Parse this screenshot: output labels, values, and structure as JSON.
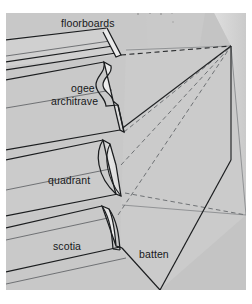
{
  "figure": {
    "name": "moulding-perspective-diagram",
    "kind": "architectural-perspective-drawing",
    "background_color": "#ffffff",
    "panel_color": "#c9c9c9",
    "wall_color": "#d9d9d9",
    "wall_shadow_color": "#bdbdbd",
    "moulding_face_color": "#d2d2d2",
    "moulding_highlight_color": "#e2e2e2",
    "line_color": "#17191b",
    "construction_line_color": "#7d7f82"
  },
  "labels": {
    "floorboards": "floorboards",
    "ogee": "ogee",
    "architrave": "architrave",
    "quadrant": "quadrant",
    "scotia": "scotia",
    "batten": "batten"
  },
  "label_positions": {
    "floorboards": {
      "x": 61,
      "y": 27
    },
    "ogee": {
      "x": 71,
      "y": 92
    },
    "architrave": {
      "x": 51,
      "y": 105
    },
    "quadrant": {
      "x": 48,
      "y": 184
    },
    "scotia": {
      "x": 53,
      "y": 250
    },
    "batten": {
      "x": 139,
      "y": 258
    }
  },
  "vanishing_points": [
    {
      "name": "upper-vanishing-point",
      "x": 231,
      "y": 46
    },
    {
      "name": "lower-vanishing-point",
      "x": 246,
      "y": 215
    }
  ],
  "moulding_sections": [
    {
      "name": "floorboards",
      "order": 1
    },
    {
      "name": "ogee-architrave",
      "order": 2
    },
    {
      "name": "quadrant",
      "order": 3
    },
    {
      "name": "scotia",
      "order": 4
    },
    {
      "name": "batten",
      "order": 5
    }
  ]
}
